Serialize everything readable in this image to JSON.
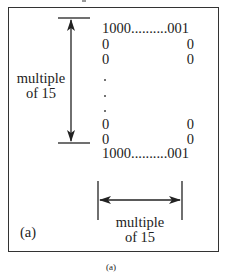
{
  "figure": {
    "panel_label": "(a)",
    "caption": "(a)",
    "vertical_dimension": {
      "label_line1": "multiple",
      "label_line2": "of 15"
    },
    "horizontal_dimension": {
      "label_line1": "multiple",
      "label_line2": "of 15"
    },
    "matrix_rows": [
      {
        "type": "full",
        "text": "1000..........001"
      },
      {
        "type": "pair",
        "left": "0",
        "right": "0"
      },
      {
        "type": "pair",
        "left": "0",
        "right": "0"
      },
      {
        "type": "ellipsis"
      },
      {
        "type": "ellipsis"
      },
      {
        "type": "ellipsis"
      },
      {
        "type": "pair",
        "left": "0",
        "right": "0"
      },
      {
        "type": "pair",
        "left": "0",
        "right": "0"
      },
      {
        "type": "full",
        "text": "1000..........001"
      }
    ],
    "colors": {
      "line": "#222222",
      "border": "#333333",
      "background": "#ffffff"
    }
  }
}
